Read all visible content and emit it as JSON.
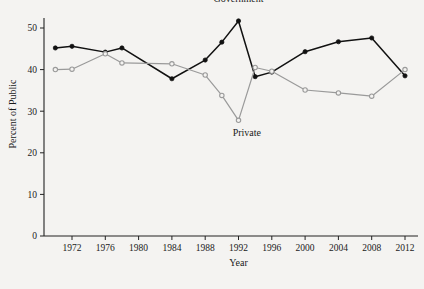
{
  "chart_data": {
    "type": "line",
    "title": "",
    "xlabel": "Year",
    "ylabel": "Percent of Public",
    "xlim": [
      1970,
      2012
    ],
    "ylim": [
      0,
      53
    ],
    "yticks": [
      0,
      10,
      20,
      30,
      40,
      50
    ],
    "ytick_labels": [
      "0",
      "10",
      "20",
      "30",
      "40",
      "50"
    ],
    "xticks": [
      1972,
      1976,
      1980,
      1984,
      1988,
      1992,
      1996,
      2000,
      2004,
      2008,
      2012
    ],
    "xtick_labels": [
      "1972",
      "1976",
      "1980",
      "1984",
      "1988",
      "1992",
      "1996",
      "2000",
      "2004",
      "2008",
      "2012"
    ],
    "grid": false,
    "legend_position": "inline-annotations",
    "series": [
      {
        "name": "Government",
        "color": "#111111",
        "marker": "filled-circle",
        "label_text": "Government",
        "label_x": 1992,
        "label_y": 56.2,
        "x": [
          1970,
          1972,
          1976,
          1978,
          1984,
          1988,
          1990,
          1992,
          1994,
          1996,
          2000,
          2004,
          2008,
          2012
        ],
        "values": [
          45.2,
          45.6,
          44.2,
          45.2,
          37.8,
          42.3,
          46.6,
          51.7,
          38.3,
          39.4,
          44.3,
          46.7,
          47.6,
          38.5
        ]
      },
      {
        "name": "Private",
        "color": "#9a9a9a",
        "marker": "open-circle",
        "label_text": "Private",
        "label_x": 1993,
        "label_y": 24.0,
        "x": [
          1970,
          1972,
          1976,
          1978,
          1984,
          1988,
          1990,
          1992,
          1994,
          1996,
          2000,
          2004,
          2008,
          2012
        ],
        "values": [
          40.0,
          40.1,
          43.8,
          41.6,
          41.4,
          38.7,
          33.8,
          27.8,
          40.5,
          39.6,
          35.1,
          34.4,
          33.6,
          40.0
        ]
      }
    ]
  }
}
